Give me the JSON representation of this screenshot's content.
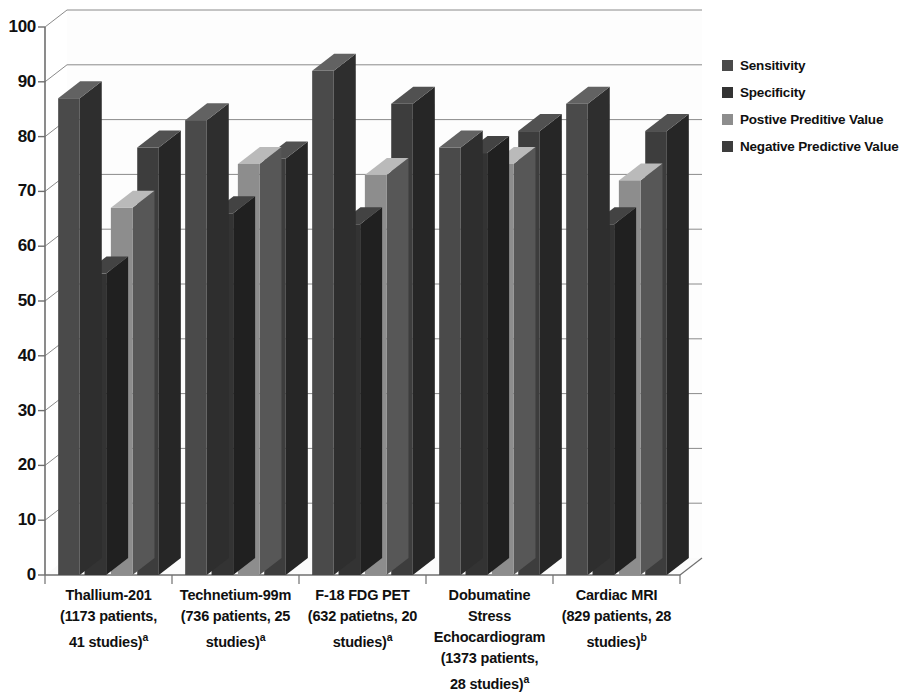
{
  "chart_data": {
    "type": "bar",
    "title": "",
    "subtitle": "",
    "xlabel": "",
    "ylabel": "",
    "ylim": [
      0,
      100
    ],
    "ytick_step": 10,
    "yticks": [
      "100",
      "90",
      "80",
      "70",
      "60",
      "50",
      "40",
      "30",
      "20",
      "10",
      "0"
    ],
    "grid": true,
    "legend_position": "right",
    "style": "3d-clustered-column",
    "categories": [
      "Thallium-201 (1173 patients, 41 studies)a",
      "Technetium-99m (736 patients, 25 studies)a",
      "F-18 FDG PET (632 patietns, 20 studies)a",
      "Dobumatine Stress Echocardiogram (1373 patients, 28 studies)a",
      "Cardiac MRI (829 patients, 28 studies)b"
    ],
    "category_lines": [
      [
        "Thallium-201",
        "(1173 patients,",
        "41 studies)",
        "a"
      ],
      [
        "Technetium-99m",
        "(736 patients, 25",
        "studies)",
        "a"
      ],
      [
        "F-18 FDG PET",
        "(632 patietns, 20",
        "studies)",
        "a"
      ],
      [
        "Dobumatine",
        "Stress",
        "Echocardiogram",
        "(1373 patients,",
        "28 studies)",
        "a"
      ],
      [
        "Cardiac MRI",
        "(829 patients, 28",
        "studies)",
        "b"
      ]
    ],
    "series": [
      {
        "name": "Sensitivity",
        "color": "#4a4a4a",
        "values": [
          87,
          83,
          92,
          78,
          86
        ]
      },
      {
        "name": "Specificity",
        "color": "#333333",
        "values": [
          55,
          66,
          64,
          77,
          64
        ]
      },
      {
        "name": "Postive Preditive Value",
        "color": "#8d8d8d",
        "values": [
          67,
          75,
          73,
          75,
          72
        ]
      },
      {
        "name": "Negative Predictive Value",
        "color": "#3d3d3d",
        "values": [
          78,
          76,
          86,
          81,
          81
        ]
      }
    ]
  },
  "legend": {
    "items": [
      {
        "label": "Sensitivity",
        "color": "#4a4a4a"
      },
      {
        "label": "Specificity",
        "color": "#333333"
      },
      {
        "label": "Postive Preditive Value",
        "color": "#8d8d8d"
      },
      {
        "label": "Negative Predictive Value",
        "color": "#3d3d3d"
      }
    ]
  },
  "axis": {
    "line_color": "#6f6f6f",
    "grid_color": "#8a8a8a"
  }
}
